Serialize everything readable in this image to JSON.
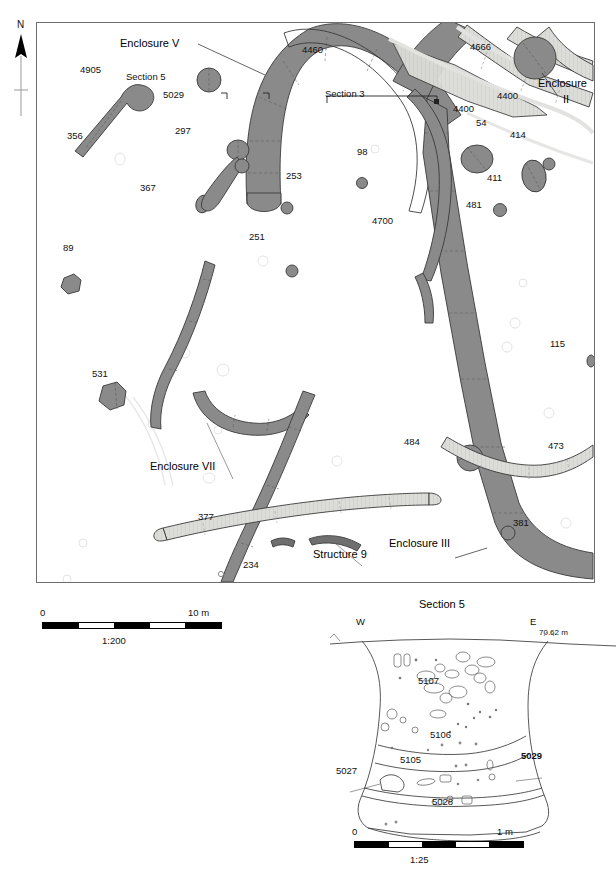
{
  "figure": {
    "north_label": "N",
    "map_scale_label": "1:200",
    "map_scale_zero": "0",
    "map_scale_max": "10 m",
    "section_title": "Section 5",
    "section_scale_label": "1:25",
    "section_scale_zero": "0",
    "section_scale_max": "1 m",
    "section_west": "W",
    "section_east": "E",
    "section_datum": "70.62 m"
  },
  "colors": {
    "ditch_dark": "#8a8a8a",
    "ditch_light": "#d6d6d2",
    "outline": "#3a3a3a",
    "frame": "#6d6d6d",
    "ghost": "#ececec"
  },
  "map_labels": [
    {
      "text": "Enclosure V",
      "x": 120,
      "y": 38,
      "size": "big"
    },
    {
      "text": "Section 5",
      "x": 126,
      "y": 72,
      "size": "norm"
    },
    {
      "text": "5029",
      "x": 163,
      "y": 90,
      "size": "norm"
    },
    {
      "text": "4905",
      "x": 80,
      "y": 65,
      "size": "norm"
    },
    {
      "text": "356",
      "x": 67,
      "y": 131,
      "size": "norm"
    },
    {
      "text": "297",
      "x": 175,
      "y": 126,
      "size": "norm"
    },
    {
      "text": "367",
      "x": 140,
      "y": 183,
      "size": "norm"
    },
    {
      "text": "4460",
      "x": 302,
      "y": 45,
      "size": "norm"
    },
    {
      "text": "Section 3",
      "x": 325,
      "y": 89,
      "size": "norm"
    },
    {
      "text": "4666",
      "x": 470,
      "y": 42,
      "size": "norm"
    },
    {
      "text": "Enclosure",
      "x": 538,
      "y": 78,
      "size": "big"
    },
    {
      "text": "II",
      "x": 563,
      "y": 94,
      "size": "big"
    },
    {
      "text": "4400",
      "x": 497,
      "y": 91,
      "size": "norm"
    },
    {
      "text": "4400",
      "x": 453,
      "y": 104,
      "size": "norm"
    },
    {
      "text": "54",
      "x": 476,
      "y": 118,
      "size": "norm"
    },
    {
      "text": "414",
      "x": 510,
      "y": 130,
      "size": "norm"
    },
    {
      "text": "411",
      "x": 487,
      "y": 173,
      "size": "norm"
    },
    {
      "text": "481",
      "x": 466,
      "y": 200,
      "size": "norm"
    },
    {
      "text": "98",
      "x": 357,
      "y": 147,
      "size": "norm"
    },
    {
      "text": "253",
      "x": 286,
      "y": 171,
      "size": "norm"
    },
    {
      "text": "4700",
      "x": 372,
      "y": 216,
      "size": "norm"
    },
    {
      "text": "251",
      "x": 249,
      "y": 232,
      "size": "norm"
    },
    {
      "text": "89",
      "x": 63,
      "y": 243,
      "size": "norm"
    },
    {
      "text": "115",
      "x": 550,
      "y": 339,
      "size": "norm"
    },
    {
      "text": "531",
      "x": 92,
      "y": 369,
      "size": "norm"
    },
    {
      "text": "484",
      "x": 404,
      "y": 437,
      "size": "norm"
    },
    {
      "text": "473",
      "x": 548,
      "y": 441,
      "size": "norm"
    },
    {
      "text": "Enclosure VII",
      "x": 150,
      "y": 461,
      "size": "big"
    },
    {
      "text": "377",
      "x": 198,
      "y": 512,
      "size": "norm"
    },
    {
      "text": "381",
      "x": 513,
      "y": 518,
      "size": "norm"
    },
    {
      "text": "Structure 9",
      "x": 313,
      "y": 549,
      "size": "big"
    },
    {
      "text": "Enclosure III",
      "x": 389,
      "y": 538,
      "size": "big"
    },
    {
      "text": "234",
      "x": 243,
      "y": 560,
      "size": "norm"
    }
  ],
  "section_labels": [
    {
      "text": "5107",
      "x": 418,
      "y": 676,
      "size": "norm",
      "bold": false
    },
    {
      "text": "5106",
      "x": 430,
      "y": 730,
      "size": "norm",
      "bold": false
    },
    {
      "text": "5105",
      "x": 400,
      "y": 755,
      "size": "norm",
      "bold": false
    },
    {
      "text": "5029",
      "x": 521,
      "y": 751,
      "size": "norm",
      "bold": true
    },
    {
      "text": "5027",
      "x": 336,
      "y": 766,
      "size": "norm",
      "bold": false
    },
    {
      "text": "5028",
      "x": 432,
      "y": 797,
      "size": "norm",
      "bold": false
    }
  ]
}
